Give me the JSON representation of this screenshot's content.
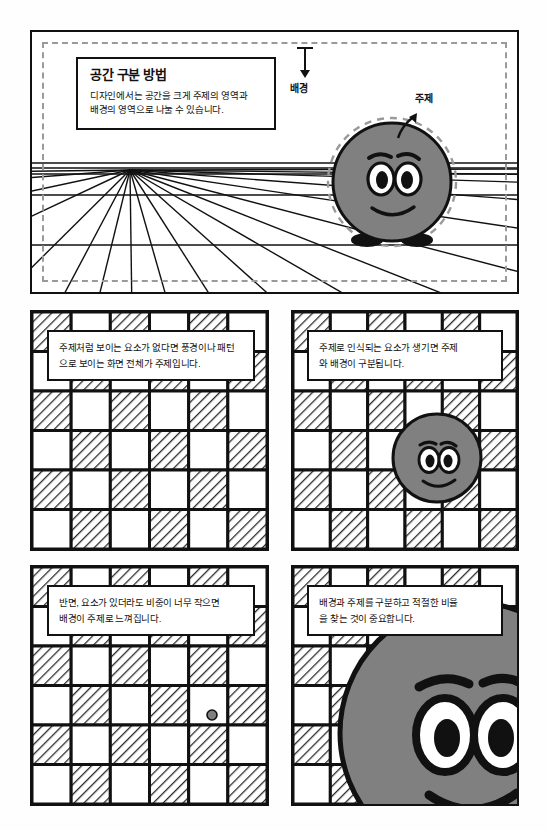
{
  "page": {
    "language": "ko",
    "topic": "공간 구분 방법",
    "colors": {
      "ink": "#111111",
      "blob_fill": "#808080",
      "hatch": "#d8d8d8",
      "dashed_guide": "#9a9a9a",
      "paper": "#fefefe"
    }
  },
  "panel1": {
    "caption": {
      "title": "공간 구분 방법",
      "line1": "디자인에서는 공간을 크게 주제의 영역과",
      "line2": "배경의 영역으로 나눌 수 있습니다."
    },
    "labels": {
      "background": "배경",
      "subject": "주제"
    },
    "icons": {
      "background_arrow": "arrow-down-icon",
      "subject_arrow": "arrow-up-left-icon"
    },
    "scene": {
      "description": "one-point-perspective grid with a gray blob character standing on the ground plane",
      "vanishing_point_x": 98,
      "vanishing_point_y": 138,
      "horizon_y": 138,
      "ray_count": 16,
      "character": {
        "cx": 360,
        "cy": 150,
        "r": 60,
        "outline_dashed": true
      }
    }
  },
  "panel2": {
    "text": {
      "line1": "주제처럼 보이는 요소가 없다면 풍경이나 패턴",
      "line2": "으로 보이는 화면 전체가 주제입니다."
    },
    "checker": {
      "cols": 6,
      "rows": 6,
      "first_cell": "hatched"
    },
    "subject": "none"
  },
  "panel3": {
    "text": {
      "line1": "주제로 인식되는 요소가 생기면 주제",
      "line2": "와 배경이 구분됩니다."
    },
    "checker": {
      "cols": 6,
      "rows": 6,
      "first_cell": "hatched"
    },
    "subject": {
      "type": "medium-blob",
      "diameter": 92
    }
  },
  "panel4": {
    "text": {
      "line1": "반면, 요소가 있더라도 비중이 너무 작으면",
      "line2": "배경이 주제로 느껴집니다."
    },
    "checker": {
      "cols": 6,
      "rows": 6,
      "first_cell": "hatched"
    },
    "subject": {
      "type": "tiny-dot",
      "diameter": 12
    }
  },
  "panel5": {
    "text": {
      "line1": "배경과 주제를 구분하고 적절한 비율",
      "line2": "을 찾는 것이 중요합니다."
    },
    "checker": {
      "cols": 6,
      "rows": 6,
      "first_cell": "hatched"
    },
    "subject": {
      "type": "oversized-blob",
      "diameter": 268
    }
  }
}
